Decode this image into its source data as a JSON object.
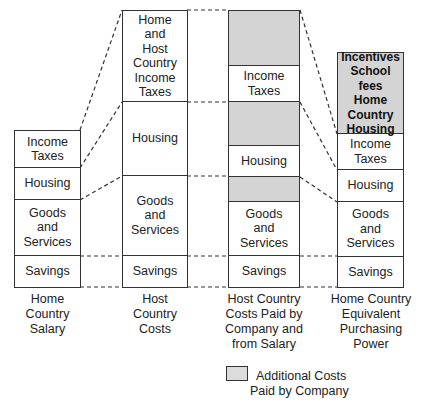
{
  "columns": [
    {
      "caption": [
        "Home",
        "Country",
        "Salary"
      ],
      "segments": [
        {
          "label": "Income\nTaxes",
          "fill": "white"
        },
        {
          "label": "Housing",
          "fill": "white"
        },
        {
          "label": "Goods\nand\nServices",
          "fill": "white"
        },
        {
          "label": "Savings",
          "fill": "white"
        }
      ]
    },
    {
      "caption": [
        "Host",
        "Country",
        "Costs"
      ],
      "segments": [
        {
          "label": "Home\nand\nHost\nCountry\nIncome\nTaxes",
          "fill": "white"
        },
        {
          "label": "Housing",
          "fill": "white"
        },
        {
          "label": "Goods\nand\nServices",
          "fill": "white"
        },
        {
          "label": "Savings",
          "fill": "white"
        }
      ]
    },
    {
      "caption": [
        "Host Country",
        "Costs Paid by",
        "Company and",
        "from Salary"
      ],
      "segments": [
        {
          "label": "",
          "fill": "grey"
        },
        {
          "label": "Income\nTaxes",
          "fill": "white"
        },
        {
          "label": "",
          "fill": "grey"
        },
        {
          "label": "Housing",
          "fill": "white"
        },
        {
          "label": "",
          "fill": "grey"
        },
        {
          "label": "Goods\nand\nServices",
          "fill": "white"
        },
        {
          "label": "Savings",
          "fill": "white"
        }
      ]
    },
    {
      "caption": [
        "Home Country",
        "Equivalent",
        "Purchasing",
        "Power"
      ],
      "segments": [
        {
          "label": "Incentives\nSchool fees\nHome\nCountry\nHousing",
          "fill": "grey"
        },
        {
          "label": "Income\nTaxes",
          "fill": "white"
        },
        {
          "label": "Housing",
          "fill": "white"
        },
        {
          "label": "Goods\nand\nServices",
          "fill": "white"
        },
        {
          "label": "Savings",
          "fill": "white"
        }
      ]
    }
  ],
  "legend": {
    "label_line1": "Additional Costs",
    "label_line2": "Paid by Company",
    "swatch_color": "#d4d4d4"
  },
  "colors": {
    "grey_fill": "#d4d4d4",
    "border": "#333333"
  }
}
